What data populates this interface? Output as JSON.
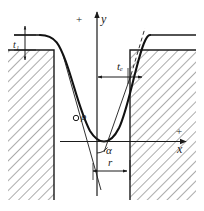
{
  "diagram": {
    "type": "engineering-cross-section",
    "axes": {
      "y_axis": {
        "sign": "+",
        "label": "y",
        "direction": "up"
      },
      "x_axis": {
        "sign": "+",
        "label": "x",
        "direction": "right"
      }
    },
    "labels": {
      "thickness_left": {
        "symbol": "t",
        "subscript": "1",
        "text": "t₁"
      },
      "thickness_edge": {
        "symbol": "t",
        "subscript": "e",
        "text": "tₑ"
      },
      "radius_of_curvature": {
        "text": "ρ"
      },
      "angle": {
        "text": "α"
      },
      "groove_radius": {
        "text": "r"
      }
    },
    "colors": {
      "stroke": "#1a1a1a",
      "hatch": "#555555",
      "background": "#ffffff",
      "profile": "#111111"
    },
    "features": [
      "left-hatched-block",
      "right-hatched-block",
      "groove-profile-curve",
      "tangent-line-lower-left",
      "tangent-line-upper-right-dashed",
      "point-marker-rho",
      "angle-arc-alpha",
      "dimension-r",
      "dimension-te",
      "dimension-t1"
    ]
  }
}
